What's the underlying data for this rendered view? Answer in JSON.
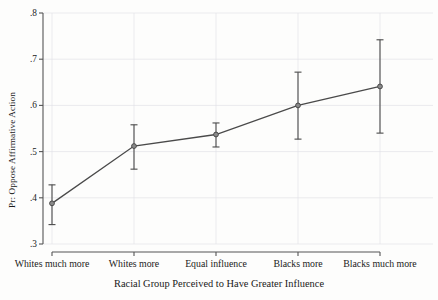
{
  "chart_data": {
    "type": "line",
    "title": "",
    "xlabel": "Racial Group Perceived to Have Greater Influence",
    "ylabel": "Pr: Oppose Affirmative Action",
    "categories": [
      "Whites much more",
      "Whites more",
      "Equal influence",
      "Blacks more",
      "Blacks much more"
    ],
    "values": [
      0.388,
      0.512,
      0.537,
      0.6,
      0.641
    ],
    "error_low": [
      0.342,
      0.462,
      0.51,
      0.527,
      0.54
    ],
    "error_high": [
      0.428,
      0.558,
      0.562,
      0.672,
      0.742
    ],
    "ylim": [
      0.3,
      0.8
    ],
    "yticks": [
      0.3,
      0.4,
      0.5,
      0.6,
      0.7,
      0.8
    ],
    "ytick_labels": [
      ".3",
      ".4",
      ".5",
      ".6",
      ".7",
      ".8"
    ],
    "grid": true,
    "legend": "none",
    "marker": "circle",
    "series_color": "#4a4a4a",
    "grid_color": "#e2e2e8",
    "axis_color": "#555555"
  }
}
